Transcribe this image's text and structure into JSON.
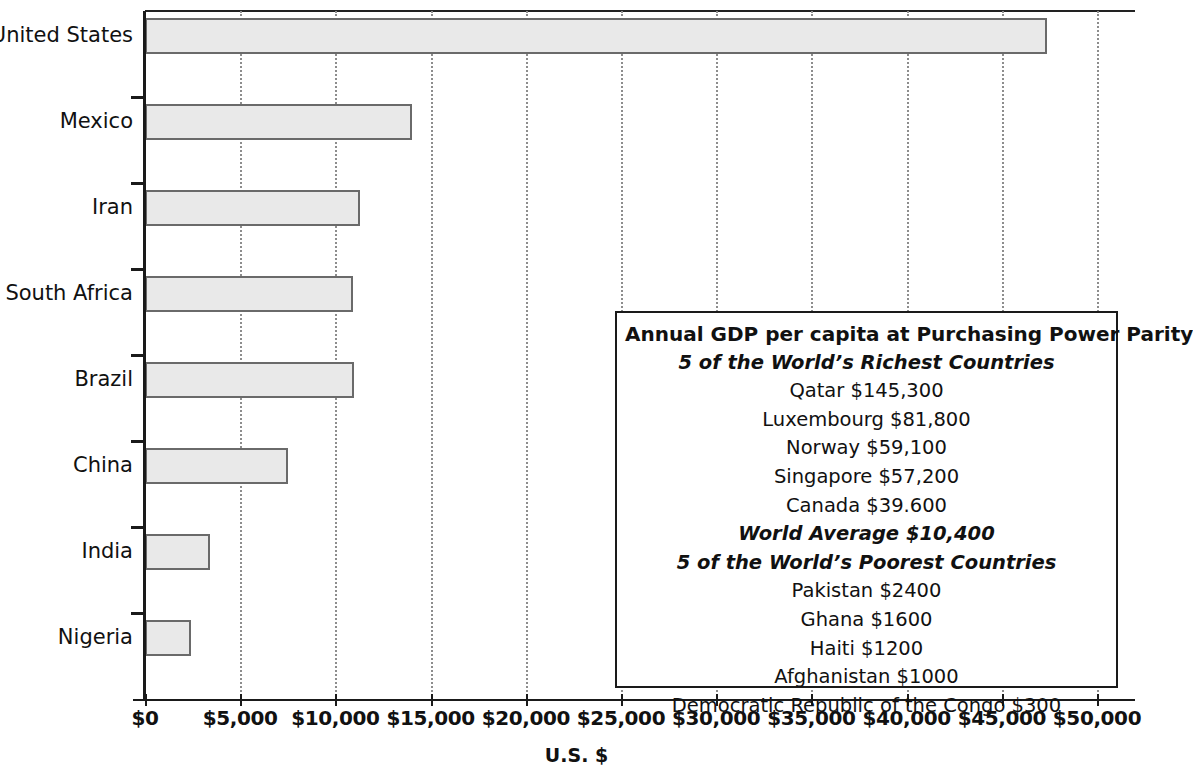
{
  "chart_data": {
    "type": "bar",
    "orientation": "horizontal",
    "title": "",
    "xlabel": "U.S. $",
    "ylabel": "",
    "xlim": [
      0,
      50000
    ],
    "xtick_values": [
      0,
      5000,
      10000,
      15000,
      20000,
      25000,
      30000,
      35000,
      40000,
      45000,
      50000
    ],
    "xtick_labels": [
      "$0",
      "$5,000",
      "$10,000",
      "$15,000",
      "$20,000",
      "$25,000",
      "$30,000",
      "$35,000",
      "$40,000",
      "$45,000",
      "$50,000"
    ],
    "grid": true,
    "grid_axis": "x",
    "legend": "none",
    "categories": [
      "United States",
      "Mexico",
      "Iran",
      "South Africa",
      "Brazil",
      "China",
      "India",
      "Nigeria"
    ],
    "values": [
      47400,
      14000,
      11300,
      10900,
      11000,
      7500,
      3400,
      2400
    ],
    "bar_fill_color": "#e9e9e9",
    "bar_edge_color": "#6a6a6a"
  },
  "annotation_box": {
    "title": "Annual GDP per capita at Purchasing Power Parity",
    "richest_heading": "5 of the World’s Richest Countries",
    "richest": [
      "Qatar $145,300",
      "Luxembourg $81,800",
      "Norway $59,100",
      "Singapore $57,200",
      "Canada $39.600"
    ],
    "world_average": "World Average $10,400",
    "poorest_heading": "5 of the World’s Poorest Countries",
    "poorest": [
      "Pakistan $2400",
      "Ghana $1600",
      "Haiti $1200",
      "Afghanistan $1000",
      "Democratic Republic of the Congo $300"
    ]
  }
}
